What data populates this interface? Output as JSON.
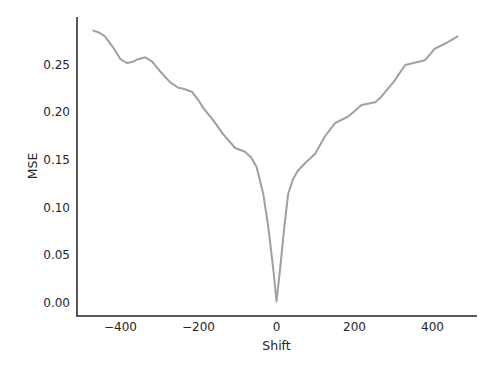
{
  "chart_data": {
    "type": "line",
    "title": "",
    "xlabel": "Shift",
    "ylabel": "MSE",
    "xlim": [
      -520,
      510
    ],
    "ylim": [
      -0.014,
      0.3
    ],
    "xticks": [
      -400,
      -200,
      0,
      200,
      400
    ],
    "xtick_labels": [
      "−400",
      "−200",
      "0",
      "200",
      "400"
    ],
    "yticks": [
      0.0,
      0.05,
      0.1,
      0.15,
      0.2,
      0.25
    ],
    "ytick_labels": [
      "0.00",
      "0.05",
      "0.10",
      "0.15",
      "0.20",
      "0.25"
    ],
    "grid": false,
    "legend": null,
    "series": [
      {
        "name": "MSE",
        "color": "#a0a0a0",
        "x": [
          -470,
          -455,
          -440,
          -420,
          -400,
          -384,
          -370,
          -355,
          -337,
          -320,
          -300,
          -273,
          -252,
          -239,
          -217,
          -200,
          -188,
          -162,
          -136,
          -106,
          -81,
          -65,
          -51,
          -34,
          -21,
          -8,
          0,
          9,
          20,
          30,
          43,
          55,
          73,
          99,
          124,
          150,
          184,
          218,
          253,
          265,
          283,
          300,
          330,
          351,
          381,
          406,
          436,
          464
        ],
        "y": [
          0.285,
          0.283,
          0.279,
          0.268,
          0.255,
          0.251,
          0.252,
          0.255,
          0.257,
          0.253,
          0.243,
          0.231,
          0.225,
          0.224,
          0.221,
          0.212,
          0.204,
          0.191,
          0.176,
          0.162,
          0.158,
          0.152,
          0.142,
          0.114,
          0.079,
          0.034,
          0.001,
          0.034,
          0.079,
          0.114,
          0.13,
          0.138,
          0.146,
          0.156,
          0.174,
          0.188,
          0.195,
          0.207,
          0.21,
          0.214,
          0.223,
          0.231,
          0.249,
          0.251,
          0.254,
          0.266,
          0.272,
          0.279
        ]
      }
    ]
  }
}
